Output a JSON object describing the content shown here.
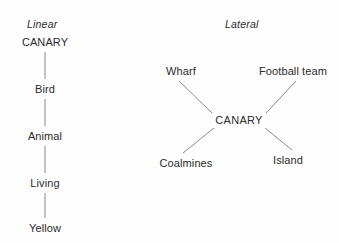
{
  "figure": {
    "background_color": "#fefefe",
    "text_color": "#2b2b2b",
    "line_color": "#7d7d7d"
  },
  "panels": {
    "linear": {
      "title": "Linear",
      "type": "vertical-chain",
      "nodes": [
        {
          "label": "CANARY",
          "x": 45,
          "y": 42
        },
        {
          "label": "Bird",
          "x": 45,
          "y": 89
        },
        {
          "label": "Animal",
          "x": 45,
          "y": 136
        },
        {
          "label": "Living",
          "x": 45,
          "y": 183
        },
        {
          "label": "Yellow",
          "x": 45,
          "y": 228
        }
      ],
      "edges": [
        {
          "from": "CANARY",
          "to": "Bird",
          "x1": 45,
          "y1": 52,
          "x2": 45,
          "y2": 79
        },
        {
          "from": "Bird",
          "to": "Animal",
          "x1": 45,
          "y1": 99,
          "x2": 45,
          "y2": 126
        },
        {
          "from": "Animal",
          "to": "Living",
          "x1": 45,
          "y1": 146,
          "x2": 45,
          "y2": 173
        },
        {
          "from": "Living",
          "to": "Yellow",
          "x1": 45,
          "y1": 193,
          "x2": 45,
          "y2": 218
        }
      ]
    },
    "lateral": {
      "title": "Lateral",
      "type": "radial-star",
      "center": {
        "label": "CANARY",
        "x": 239,
        "y": 120
      },
      "nodes": [
        {
          "label": "Wharf",
          "x": 181,
          "y": 71,
          "position": "top-left"
        },
        {
          "label": "Football team",
          "x": 293,
          "y": 71,
          "position": "top-right"
        },
        {
          "label": "Coalmines",
          "x": 186,
          "y": 163,
          "position": "bottom-left"
        },
        {
          "label": "Island",
          "x": 288,
          "y": 160,
          "position": "bottom-right"
        }
      ],
      "edges": [
        {
          "from": "Wharf",
          "to": "CANARY",
          "x1": 179,
          "y1": 81,
          "x2": 212,
          "y2": 113
        },
        {
          "from": "Football team",
          "to": "CANARY",
          "x1": 296,
          "y1": 81,
          "x2": 266,
          "y2": 113
        },
        {
          "from": "Coalmines",
          "to": "CANARY",
          "x1": 183,
          "y1": 153,
          "x2": 214,
          "y2": 128
        },
        {
          "from": "Island",
          "to": "CANARY",
          "x1": 292,
          "y1": 150,
          "x2": 265,
          "y2": 128
        }
      ]
    }
  }
}
